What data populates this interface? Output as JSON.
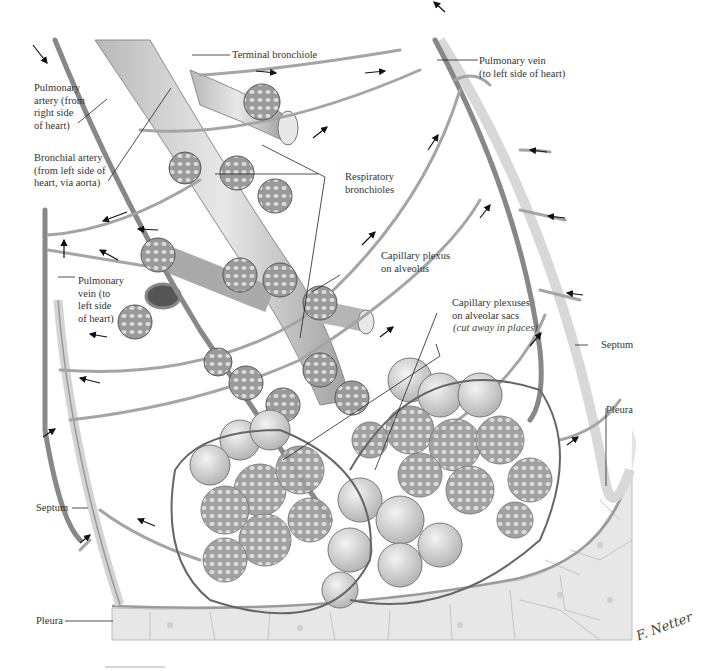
{
  "figure": {
    "signature": "F. Netter"
  },
  "labels": {
    "terminal_bronchiole": "Terminal bronchiole",
    "pulmonary_vein_top": "Pulmonary vein\n(to left side of heart)",
    "pulmonary_artery": "Pulmonary\nartery (from\nright side\nof heart)",
    "bronchial_artery": "Bronchial artery\n(from left side of\nheart, via aorta)",
    "respiratory_bronchioles": "Respiratory\nbronchioles",
    "capillary_plexus_alveolus": "Capillary plexus\non alveolus",
    "pulmonary_vein_left": "Pulmonary\nvein (to\nleft side\nof heart)",
    "capillary_plexuses_sacs": "Capillary plexuses\non alveolar sacs",
    "capillary_plexuses_sacs_note": "(cut away in places)",
    "septum_right": "Septum",
    "pleura_right": "Pleura",
    "septum_left": "Septum",
    "pleura_left": "Pleura"
  },
  "colors": {
    "vessel": "#8a8a8a",
    "vessel_light": "#c8c8c8",
    "alveolus": "#d9d9d9",
    "pleura_cells": "#e6e6e6",
    "leader_line": "#222222",
    "text": "#333333"
  }
}
